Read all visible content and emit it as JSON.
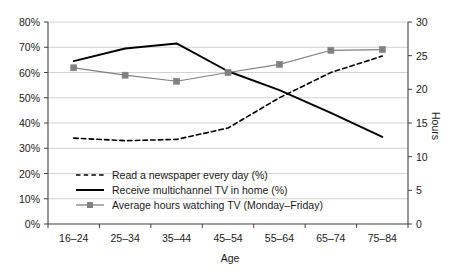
{
  "chart_data": {
    "type": "line",
    "title": "",
    "subtitle": "",
    "xlabel": "Age",
    "ylabel": "",
    "y2label": "Hours",
    "categories": [
      "16–24",
      "25–34",
      "35–44",
      "45–54",
      "55–64",
      "65–74",
      "75–84"
    ],
    "ylim": [
      0,
      80
    ],
    "y2lim": [
      0,
      30
    ],
    "yticks": [
      "0%",
      "10%",
      "20%",
      "30%",
      "40%",
      "50%",
      "60%",
      "70%",
      "80%"
    ],
    "ytick_values": [
      0,
      10,
      20,
      30,
      40,
      50,
      60,
      70,
      80
    ],
    "y2ticks": [
      "0",
      "5",
      "10",
      "15",
      "20",
      "25",
      "30"
    ],
    "y2tick_values": [
      0,
      5,
      10,
      15,
      20,
      25,
      30
    ],
    "grid": true,
    "legend_position": "inside-lower-left",
    "series": [
      {
        "name": "Read a newspaper every day (%)",
        "axis": "left",
        "style": "dashed",
        "color": "#000000",
        "marker": "none",
        "values": [
          34,
          33,
          33.5,
          38,
          50,
          60,
          66.5
        ]
      },
      {
        "name": "Receive multichannel TV in home (%)",
        "axis": "left",
        "style": "solid",
        "color": "#000000",
        "marker": "none",
        "values": [
          64.5,
          69.5,
          71.5,
          60.5,
          53,
          44,
          34.5
        ]
      },
      {
        "name": "Average hours watching TV (Monday–Friday)",
        "axis": "right",
        "style": "solid",
        "color": "#808080",
        "marker": "square",
        "values": [
          23.2,
          22.1,
          21.2,
          22.5,
          23.7,
          25.8,
          25.9
        ]
      }
    ]
  },
  "colors": {
    "axis": "#404040",
    "grid": "#c8c8c8",
    "series_dark": "#000000",
    "series_gray": "#808080",
    "background": "#ffffff",
    "text": "#1a1a1a"
  }
}
